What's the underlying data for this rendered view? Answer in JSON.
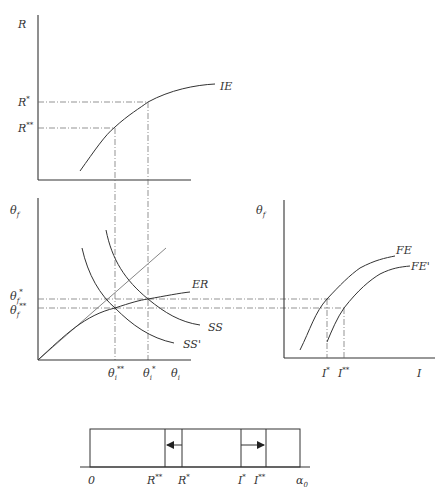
{
  "panels": {
    "top": {
      "y_axis_label": "R",
      "y_ticks": [
        {
          "base": "R",
          "sup": "*"
        },
        {
          "base": "R",
          "sup": "**"
        }
      ],
      "curve_label": "IE"
    },
    "middle_left": {
      "y_axis_label": "θf",
      "y_ticks": [
        {
          "base": "θf",
          "sup": "*"
        },
        {
          "base": "θf",
          "sup": "**"
        }
      ],
      "x_ticks": [
        {
          "base": "θi",
          "sup": "**"
        },
        {
          "base": "θi",
          "sup": "*"
        }
      ],
      "x_axis_label": "θi",
      "curves": [
        "ER",
        "SS",
        "SS'"
      ]
    },
    "middle_right": {
      "y_axis_label": "θf",
      "x_ticks": [
        {
          "base": "I",
          "sup": "*"
        },
        {
          "base": "I",
          "sup": "**"
        }
      ],
      "x_axis_label": "I",
      "curves": [
        "FE",
        "FE'"
      ]
    },
    "bottom_bar": {
      "labels": [
        {
          "base": "0",
          "sup": ""
        },
        {
          "base": "R",
          "sup": "**"
        },
        {
          "base": "R",
          "sup": "*"
        },
        {
          "base": "I",
          "sup": "*"
        },
        {
          "base": "I",
          "sup": "**"
        },
        {
          "base": "α0",
          "sup": ""
        }
      ],
      "arrows": [
        {
          "from": "R*",
          "to": "R**",
          "direction": "left"
        },
        {
          "from": "I*",
          "to": "I**",
          "direction": "right"
        }
      ]
    }
  }
}
